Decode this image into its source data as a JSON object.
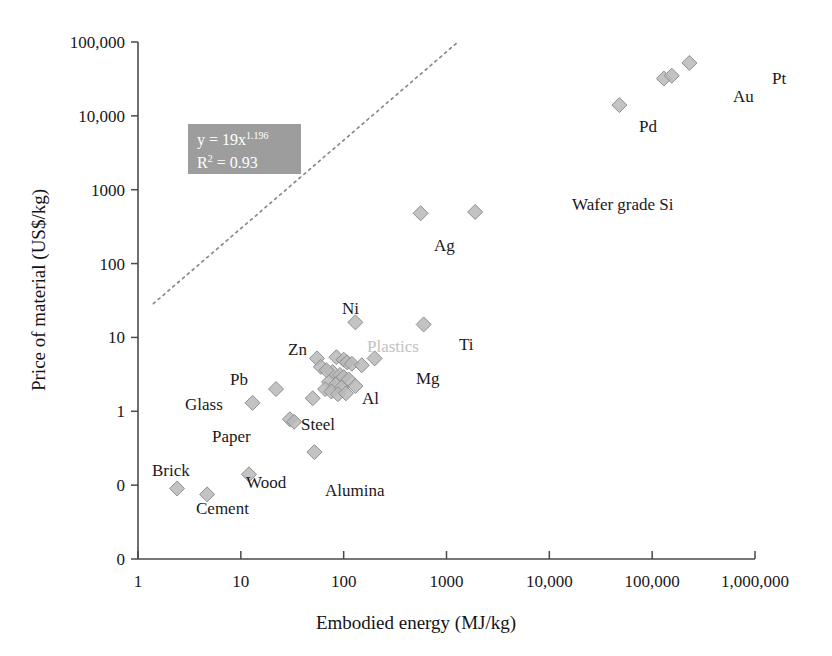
{
  "chart_data": {
    "type": "scatter",
    "title": "",
    "xlabel": "Embodied energy (MJ/kg)",
    "ylabel": "Price of material (US$/kg)",
    "xscale": "log",
    "yscale": "log",
    "xlim": [
      1,
      1000000
    ],
    "ylim": [
      0.01,
      100000
    ],
    "grid": false,
    "legend": "none",
    "xticks": [
      "1",
      "10",
      "100",
      "1000",
      "10,000",
      "100,000",
      "1,000,000"
    ],
    "xtick_values": [
      1,
      10,
      100,
      1000,
      10000,
      100000,
      1000000
    ],
    "yticks": [
      "100,000",
      "10,000",
      "1000",
      "100",
      "10",
      "1",
      "0",
      "0"
    ],
    "ytick_values": [
      100000,
      10000,
      1000,
      100,
      10,
      1,
      0.1,
      0.01
    ],
    "marker": "diamond",
    "marker_color": "#b9b9b9",
    "marker_edge_color": "#8f8f8f",
    "trendline": {
      "style": "dotted",
      "color": "#8a8a8a",
      "equation": "y = 19x",
      "exponent": "1.196",
      "r_squared_label": "R",
      "r_squared_value": "= 0.93",
      "coefficient": 19,
      "power": 1.196,
      "r2": 0.93
    },
    "annotations": [
      {
        "label": "Pt",
        "x": 230000,
        "y": 52000,
        "lx": 772,
        "ly": 70,
        "faded": false
      },
      {
        "label": "Au",
        "x": 130000,
        "y": 32000,
        "lx": 733,
        "ly": 88,
        "faded": false
      },
      {
        "label": "Pd",
        "x": 48000,
        "y": 14000,
        "lx": 639,
        "ly": 118,
        "faded": false
      },
      {
        "label": "Wafer grade Si",
        "x": 1900,
        "y": 500,
        "lx": 572,
        "ly": 196,
        "faded": false
      },
      {
        "label": "Ag",
        "x": 560,
        "y": 480,
        "lx": 434,
        "ly": 237,
        "faded": false
      },
      {
        "label": "Ti",
        "x": 600,
        "y": 15,
        "lx": 459,
        "ly": 336,
        "faded": false
      },
      {
        "label": "Ni",
        "x": 130,
        "y": 16,
        "lx": 342,
        "ly": 300,
        "faded": false
      },
      {
        "label": "Plastics",
        "x": 90,
        "y": 3.5,
        "lx": 367,
        "ly": 338,
        "faded": true
      },
      {
        "label": "Zn",
        "x": 55,
        "y": 5.2,
        "lx": 288,
        "ly": 341,
        "faded": false
      },
      {
        "label": "Mg",
        "x": 200,
        "y": 5.2,
        "lx": 416,
        "ly": 370,
        "faded": false
      },
      {
        "label": "Al",
        "x": 110,
        "y": 2.3,
        "lx": 362,
        "ly": 390,
        "faded": false
      },
      {
        "label": "Pb",
        "x": 22,
        "y": 2.0,
        "lx": 230,
        "ly": 371,
        "faded": false
      },
      {
        "label": "Glass",
        "x": 13,
        "y": 1.3,
        "lx": 185,
        "ly": 396,
        "faded": false
      },
      {
        "label": "Steel",
        "x": 30,
        "y": 0.75,
        "lx": 301,
        "ly": 416,
        "faded": false
      },
      {
        "label": "Paper",
        "x": 27,
        "y": 0.7,
        "lx": 212,
        "ly": 428,
        "faded": false
      },
      {
        "label": "Alumina",
        "x": 52,
        "y": 0.28,
        "lx": 325,
        "ly": 482,
        "faded": false
      },
      {
        "label": "Wood",
        "x": 12,
        "y": 0.14,
        "lx": 246,
        "ly": 474,
        "faded": false
      },
      {
        "label": "Brick",
        "x": 2.4,
        "y": 0.09,
        "lx": 152,
        "ly": 462,
        "faported": false,
        "faded": false
      },
      {
        "label": "Cement",
        "x": 4.7,
        "y": 0.07,
        "lx": 196,
        "ly": 500,
        "faded": false
      }
    ],
    "points": [
      {
        "name": "Pt",
        "x": 230000,
        "y": 52000
      },
      {
        "name": "Au",
        "x": 130000,
        "y": 32000
      },
      {
        "name": "Au2",
        "x": 155000,
        "y": 35000
      },
      {
        "name": "Pd",
        "x": 48000,
        "y": 14000
      },
      {
        "name": "Wafer grade Si",
        "x": 1900,
        "y": 500
      },
      {
        "name": "Ag",
        "x": 560,
        "y": 480
      },
      {
        "name": "Ti",
        "x": 600,
        "y": 15
      },
      {
        "name": "Ni",
        "x": 130,
        "y": 16
      },
      {
        "name": "Mg",
        "x": 200,
        "y": 5.2
      },
      {
        "name": "Zn",
        "x": 55,
        "y": 5.2
      },
      {
        "name": "Plastic-1",
        "x": 85,
        "y": 5.4
      },
      {
        "name": "Plastic-2",
        "x": 100,
        "y": 5.0
      },
      {
        "name": "Plastic-3",
        "x": 108,
        "y": 4.6
      },
      {
        "name": "Plastic-4",
        "x": 120,
        "y": 4.4
      },
      {
        "name": "Plastic-5",
        "x": 150,
        "y": 4.2
      },
      {
        "name": "Plastic-6",
        "x": 78,
        "y": 3.4
      },
      {
        "name": "Plastic-7",
        "x": 92,
        "y": 3.1
      },
      {
        "name": "Plastic-8",
        "x": 100,
        "y": 2.9
      },
      {
        "name": "Plastic-9",
        "x": 112,
        "y": 2.7
      },
      {
        "name": "Plastic-10",
        "x": 72,
        "y": 2.5
      },
      {
        "name": "Plastic-11",
        "x": 84,
        "y": 2.3
      },
      {
        "name": "Plastic-12",
        "x": 95,
        "y": 2.1
      },
      {
        "name": "Plastic-13",
        "x": 66,
        "y": 2.0
      },
      {
        "name": "Plastic-14",
        "x": 76,
        "y": 1.85
      },
      {
        "name": "Plastic-15",
        "x": 88,
        "y": 1.7
      },
      {
        "name": "Al",
        "x": 130,
        "y": 2.2
      },
      {
        "name": "Al2",
        "x": 105,
        "y": 1.75
      },
      {
        "name": "Cu",
        "x": 60,
        "y": 4.0
      },
      {
        "name": "Cu2",
        "x": 68,
        "y": 3.6
      },
      {
        "name": "Pb",
        "x": 22,
        "y": 2.0
      },
      {
        "name": "Glass",
        "x": 13,
        "y": 1.3
      },
      {
        "name": "Steel",
        "x": 30,
        "y": 0.78
      },
      {
        "name": "Steel2",
        "x": 33,
        "y": 0.72
      },
      {
        "name": "Low-alloy",
        "x": 50,
        "y": 1.5
      },
      {
        "name": "Alumina",
        "x": 52,
        "y": 0.28
      },
      {
        "name": "Wood",
        "x": 12,
        "y": 0.14
      },
      {
        "name": "Cement",
        "x": 4.7,
        "y": 0.075
      },
      {
        "name": "Brick",
        "x": 2.4,
        "y": 0.09
      }
    ]
  }
}
